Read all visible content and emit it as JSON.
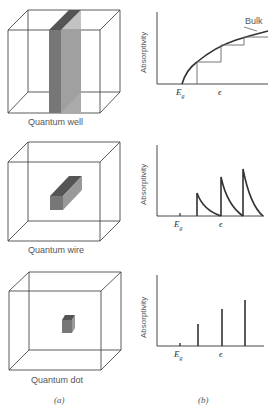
{
  "panels": {
    "a": {
      "caption": "(a)",
      "structures": [
        {
          "name": "Quantum well"
        },
        {
          "name": "Quantum wire"
        },
        {
          "name": "Quantum dot"
        }
      ]
    },
    "b": {
      "caption": "(b)",
      "ylabel": "Absorptivity",
      "xtick_eg": "E",
      "xtick_eg_sub": "g",
      "xtick_eps": "ϵ",
      "bulk_label": "Bulk"
    }
  },
  "colors": {
    "line": "#333333",
    "slab_dark": "#666666",
    "slab_mid": "#8a8a8a",
    "slab_light": "#aaaaaa"
  }
}
